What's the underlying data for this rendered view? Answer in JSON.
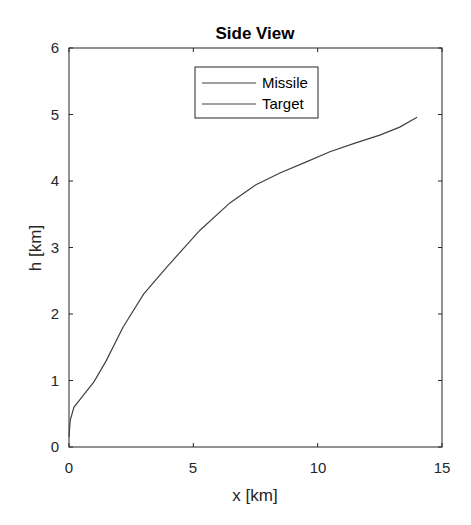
{
  "chart_data": {
    "type": "line",
    "title": "Side View",
    "xlabel": "x [km]",
    "ylabel": "h [km]",
    "xlim": [
      0,
      15
    ],
    "ylim": [
      0,
      6
    ],
    "xticks": [
      0,
      5,
      10,
      15
    ],
    "yticks": [
      0,
      1,
      2,
      3,
      4,
      5,
      6
    ],
    "grid": false,
    "legend_position": "north (inside, top-center)",
    "series": [
      {
        "name": "Missile",
        "color": "#404040",
        "x": [
          0,
          0.05,
          0.2,
          0.52,
          1.0,
          1.5,
          2.17,
          3.0,
          3.94,
          5.27,
          6.47,
          7.5,
          8.48,
          9.5,
          10.49,
          11.5,
          12.5,
          13.3,
          14.0
        ],
        "y": [
          0.15,
          0.4,
          0.6,
          0.75,
          0.98,
          1.3,
          1.8,
          2.3,
          2.71,
          3.26,
          3.67,
          3.94,
          4.12,
          4.28,
          4.44,
          4.57,
          4.69,
          4.81,
          4.96
        ]
      },
      {
        "name": "Target",
        "color": "#404040",
        "x": [],
        "y": []
      }
    ]
  },
  "legend": {
    "items": [
      {
        "label": "Missile",
        "color": "#404040"
      },
      {
        "label": "Target",
        "color": "#404040"
      }
    ]
  },
  "tick_labels": {
    "x": [
      "0",
      "5",
      "10",
      "15"
    ],
    "y": [
      "0",
      "1",
      "2",
      "3",
      "4",
      "5",
      "6"
    ]
  }
}
